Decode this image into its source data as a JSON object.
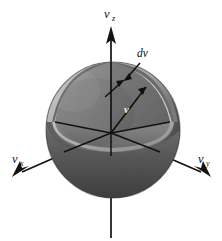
{
  "figure": {
    "background_color": "#ffffff",
    "width": 222,
    "height": 241
  },
  "axes": [
    {
      "id": "vz",
      "label": "v",
      "subscript": "z",
      "direction": "up",
      "label_x": 104,
      "label_y": 18,
      "sub_x": 112,
      "sub_y": 21
    },
    {
      "id": "vx",
      "label": "v",
      "subscript": "x",
      "direction": "down-left",
      "label_x": 12,
      "label_y": 163,
      "sub_x": 20,
      "sub_y": 166
    },
    {
      "id": "vy",
      "label": "v",
      "subscript": "y",
      "direction": "down-right",
      "label_x": 198,
      "label_y": 163,
      "sub_x": 206,
      "sub_y": 166
    }
  ],
  "annotations": [
    {
      "id": "dv",
      "text": "dv",
      "label_x": 137,
      "label_y": 57,
      "description": "shell thickness leader arrow pointing to thin spherical shell"
    },
    {
      "id": "v",
      "text": "v",
      "label_x": 124,
      "label_y": 113,
      "description": "radius vector magnitude label inside cut sphere"
    }
  ],
  "colors": {
    "outer_sphere_light": "#8c8c8c",
    "outer_sphere_dark": "#4e4e4e",
    "outer_sphere_mid": "#6e6e6e",
    "shell_band": "#b4b4b4",
    "shell_band_dark": "#7a7a7a",
    "cut_face_left": "#8a8a8a",
    "cut_face_right": "#6f6f6f",
    "cut_face_lower": "#7d7d7d",
    "inner_core": "#767676",
    "axis_stroke": "#121212",
    "label_text": "#101010",
    "radius_label_text": "#f2f2f2"
  },
  "geometry": {
    "origin_x": 111,
    "origin_y": 133,
    "sphere_center_x": 113,
    "sphere_center_y": 130,
    "sphere_radius_x": 67,
    "sphere_radius_y": 68,
    "shell_inner_radius": 60
  }
}
